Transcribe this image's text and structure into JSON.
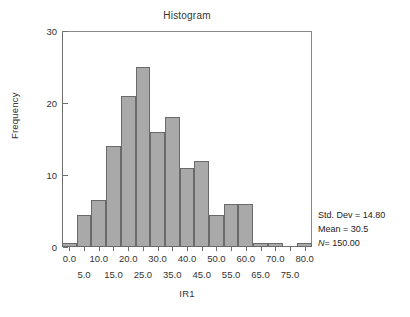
{
  "chart_data": {
    "type": "bar",
    "title": "Histogram",
    "xlabel": "IR1",
    "ylabel": "Frequency",
    "xlim": [
      -2.5,
      82.5
    ],
    "ylim": [
      0,
      30
    ],
    "grid": false,
    "legend": "none",
    "bin_width": 5,
    "bin_centers": [
      0.0,
      5.0,
      10.0,
      15.0,
      20.0,
      25.0,
      30.0,
      35.0,
      40.0,
      45.0,
      50.0,
      55.0,
      60.0,
      65.0,
      70.0,
      80.0
    ],
    "values": [
      0.5,
      4.5,
      6.5,
      14,
      21,
      25,
      16,
      18,
      11,
      12,
      4.5,
      6,
      6,
      0.5,
      0.5,
      0.5
    ],
    "x_tick_labels_upper": [
      "0.0",
      "10.0",
      "20.0",
      "30.0",
      "40.0",
      "50.0",
      "60.0",
      "70.0",
      "80.0"
    ],
    "x_tick_values_upper": [
      0,
      10,
      20,
      30,
      40,
      50,
      60,
      70,
      80
    ],
    "x_tick_labels_lower": [
      "5.0",
      "15.0",
      "25.0",
      "35.0",
      "45.0",
      "55.0",
      "65.0",
      "75.0"
    ],
    "x_tick_values_lower": [
      5,
      15,
      25,
      35,
      45,
      55,
      65,
      75
    ],
    "y_tick_labels": [
      "0",
      "10",
      "20",
      "30"
    ],
    "y_tick_values": [
      0,
      10,
      20,
      30
    ],
    "annotations": [
      "Std. Dev = 14.80",
      "Mean = 30.5",
      "N = 150.00"
    ],
    "bar_color": "#a9a9a9",
    "bar_edge_color": "#6a6a6a",
    "axis_color": "#6e6e6e",
    "text_color": "#333333"
  },
  "stats": {
    "std_dev_label": "Std. Dev = 14.80",
    "mean_label": "Mean = 30.5",
    "n_symbol": "N",
    "n_value": "= 150.00"
  }
}
